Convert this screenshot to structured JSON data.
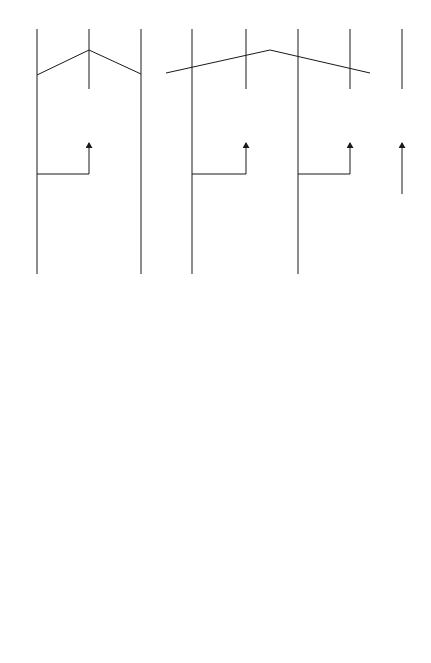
{
  "outputs": [
    {
      "id": "MC1",
      "label": "MC1",
      "x": 37
    },
    {
      "id": "MC2",
      "label": "MC2",
      "x": 89
    },
    {
      "id": "MC3",
      "label": "MC3",
      "x": 141
    },
    {
      "id": "MC4",
      "label": "MC4",
      "x": 192
    },
    {
      "id": "MC5",
      "label": "MC5",
      "x": 246
    },
    {
      "id": "MC6",
      "label": "MC6",
      "x": 298
    },
    {
      "id": "MC7",
      "label": "MC7",
      "x": 350
    },
    {
      "id": "MC8",
      "label": "MC8",
      "x": 402
    }
  ],
  "groups": {
    "hf": {
      "title": "To HF",
      "subtitle": "stages"
    },
    "lf": {
      "title": "To LF",
      "subtitle": "stages"
    }
  },
  "blocks": {
    "mc2_smoother": {
      "label": "1 ms",
      "icon": "capacitor-pair"
    },
    "mc5_smoother": {
      "label": "2 ms",
      "icon": "capacitor-pair"
    },
    "mc7_smoother": {
      "label": "2 ms",
      "icon": "capacitor-pair"
    },
    "mc8_peak_hold": {
      "line1": "Peak",
      "line2": "Hold",
      "line3": "(30 ms)"
    },
    "double_diff": {
      "line1": "Double",
      "line2": "Differen-",
      "line3": "tiator"
    },
    "filter_mc1": {
      "label": "3 kHz",
      "type": "low-pass"
    },
    "filter_mc3": {
      "label1": "400 Hz",
      "label2": "800 Hz",
      "type": "band-shelf"
    },
    "filter_mc4": {
      "label": "200 Hz",
      "type": "high-pass"
    },
    "filter_mc6": {
      "label1": "1.6 kHz",
      "label2": "800 Hz",
      "type": "band-shelf"
    },
    "filter_mc8": {
      "label": "5 kHz",
      "type": "high-pass"
    },
    "allpass_1": {
      "line1": "All-Pass",
      "line2": "Network"
    },
    "allpass_2": {
      "line1": "All-Pass",
      "line2": "Network"
    }
  },
  "inputs": {
    "main": {
      "line1": "MC1 – MC7",
      "line2": "input"
    },
    "mc8": {
      "line1": "MC8",
      "line2": "input"
    }
  },
  "colors": {
    "line": "#1a1a1a",
    "background": "#ffffff"
  }
}
